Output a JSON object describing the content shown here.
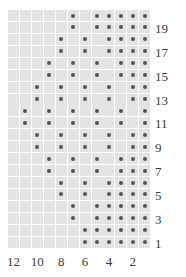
{
  "chart": {
    "type": "knitting-chart",
    "columns": 12,
    "rows": 20,
    "colors": {
      "cell": "#e4e4e4",
      "gridline": "#ffffff",
      "dot": "#555555",
      "label": "#3a3a3a"
    },
    "column_labels": [
      "12",
      "10",
      "8",
      "6",
      "4",
      "2"
    ],
    "row_labels": [
      "1",
      "3",
      "5",
      "7",
      "9",
      "11",
      "13",
      "15",
      "17",
      "19"
    ],
    "grid_rows_top_to_bottom": [
      {
        "row": 20,
        "dots_left_index": [
          5,
          7,
          8,
          9,
          10,
          11
        ]
      },
      {
        "row": 19,
        "dots_left_index": [
          5,
          7,
          8,
          9,
          10,
          11
        ]
      },
      {
        "row": 18,
        "dots_left_index": [
          4,
          6,
          8,
          9,
          10,
          11
        ]
      },
      {
        "row": 17,
        "dots_left_index": [
          4,
          6,
          8,
          9,
          10,
          11
        ]
      },
      {
        "row": 16,
        "dots_left_index": [
          3,
          5,
          7,
          9,
          10,
          11
        ]
      },
      {
        "row": 15,
        "dots_left_index": [
          3,
          5,
          7,
          9,
          10,
          11
        ]
      },
      {
        "row": 14,
        "dots_left_index": [
          2,
          4,
          6,
          8,
          10,
          11
        ]
      },
      {
        "row": 13,
        "dots_left_index": [
          2,
          4,
          6,
          8,
          10,
          11
        ]
      },
      {
        "row": 12,
        "dots_left_index": [
          1,
          3,
          5,
          7,
          9,
          11
        ]
      },
      {
        "row": 11,
        "dots_left_index": [
          1,
          3,
          5,
          7,
          9,
          11
        ]
      },
      {
        "row": 10,
        "dots_left_index": [
          2,
          4,
          6,
          8,
          10,
          11
        ]
      },
      {
        "row": 9,
        "dots_left_index": [
          2,
          4,
          6,
          8,
          10,
          11
        ]
      },
      {
        "row": 8,
        "dots_left_index": [
          3,
          5,
          7,
          9,
          10,
          11
        ]
      },
      {
        "row": 7,
        "dots_left_index": [
          3,
          5,
          7,
          9,
          10,
          11
        ]
      },
      {
        "row": 6,
        "dots_left_index": [
          4,
          6,
          8,
          9,
          10,
          11
        ]
      },
      {
        "row": 5,
        "dots_left_index": [
          4,
          6,
          8,
          9,
          10,
          11
        ]
      },
      {
        "row": 4,
        "dots_left_index": [
          5,
          7,
          8,
          9,
          10,
          11
        ]
      },
      {
        "row": 3,
        "dots_left_index": [
          5,
          7,
          8,
          9,
          10,
          11
        ]
      },
      {
        "row": 2,
        "dots_left_index": [
          6,
          7,
          8,
          9,
          10,
          11
        ]
      },
      {
        "row": 1,
        "dots_left_index": [
          6,
          7,
          8,
          9,
          10,
          11
        ]
      }
    ]
  }
}
